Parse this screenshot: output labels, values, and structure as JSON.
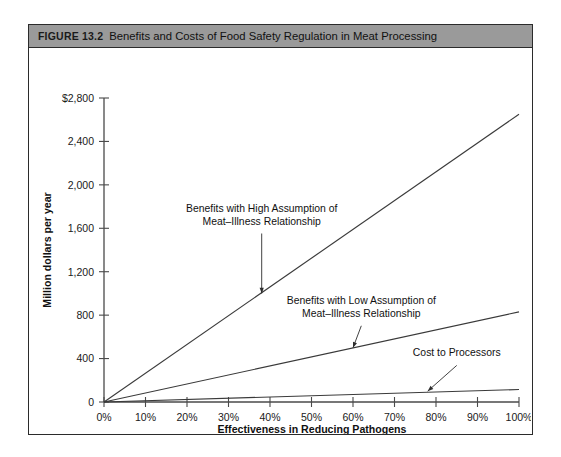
{
  "figure": {
    "label": "FIGURE 13.2",
    "title": "Benefits and Costs of Food Safety Regulation in Meat Processing",
    "titlebar_color": "#9a9a9a",
    "frame_color": "#2b2b2b"
  },
  "chart_data": {
    "type": "line",
    "title": "Benefits and Costs of Food Safety Regulation in Meat Processing",
    "xlabel": "Effectiveness in Reducing Pathogens",
    "ylabel": "Million dollars per year",
    "xlim": [
      0,
      100
    ],
    "ylim": [
      0,
      2800
    ],
    "grid": false,
    "legend": "annotations-on-plot",
    "x_tick_labels": [
      "0%",
      "10%",
      "20%",
      "30%",
      "40%",
      "50%",
      "60%",
      "70%",
      "80%",
      "90%",
      "100%"
    ],
    "x_tick_values": [
      0,
      10,
      20,
      30,
      40,
      50,
      60,
      70,
      80,
      90,
      100
    ],
    "y_tick_labels": [
      "0",
      "400",
      "800",
      "1,200",
      "1,600",
      "2,000",
      "2,400",
      "$2,800"
    ],
    "y_tick_values": [
      0,
      400,
      800,
      1200,
      1600,
      2000,
      2400,
      2800
    ],
    "series": [
      {
        "name": "Benefits with High Assumption of Meat–Illness Relationship",
        "x": [
          0,
          100
        ],
        "values": [
          0,
          2650
        ]
      },
      {
        "name": "Benefits with Low Assumption of Meat–Illness Relationship",
        "x": [
          0,
          100
        ],
        "values": [
          0,
          830
        ]
      },
      {
        "name": "Cost to Processors",
        "x": [
          0,
          100
        ],
        "values": [
          0,
          115
        ]
      }
    ],
    "annotations": [
      {
        "id": "annot-high-benefits",
        "lines": [
          "Benefits with High Assumption of",
          "Meat–Illness Relationship"
        ],
        "text_x": 38,
        "text_y": 1750,
        "arrow_to_x": 38,
        "arrow_to_y": 1000
      },
      {
        "id": "annot-low-benefits",
        "lines": [
          "Benefits with Low Assumption of",
          "Meat–Illness Relationship"
        ],
        "text_x": 62,
        "text_y": 900,
        "arrow_to_x": 60,
        "arrow_to_y": 500
      },
      {
        "id": "annot-cost",
        "lines": [
          "Cost to Processors"
        ],
        "text_x": 85,
        "text_y": 420,
        "arrow_to_x": 78,
        "arrow_to_y": 100
      }
    ]
  }
}
